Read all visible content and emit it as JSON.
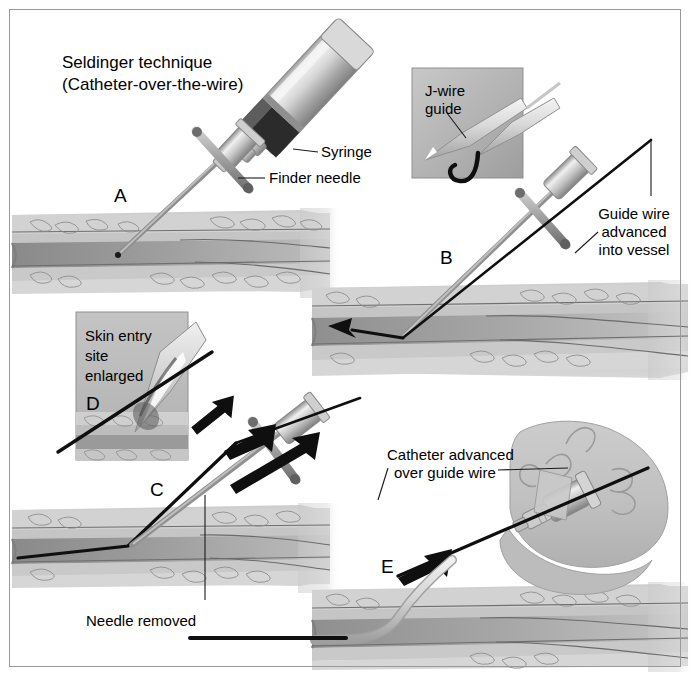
{
  "figure": {
    "title_line1": "Seldinger technique",
    "title_line2": "(Catheter-over-the-wire)",
    "background_color": "#ffffff",
    "border_color": "#9a9a9a",
    "ink_color": "#000000"
  },
  "panels": [
    {
      "letter": "A",
      "name": "needle-with-syringe-enters-vessel"
    },
    {
      "letter": "B",
      "name": "guide-wire-advanced-into-vessel"
    },
    {
      "letter": "C",
      "name": "needle-removed-over-wire"
    },
    {
      "letter": "D",
      "name": "skin-entry-site-enlarged-inset"
    },
    {
      "letter": "E",
      "name": "catheter-advanced-over-guide-wire"
    }
  ],
  "labels": {
    "syringe": "Syringe",
    "finder_needle": "Finder needle",
    "j_wire_guide_line1": "J-wire",
    "j_wire_guide_line2": "guide",
    "guide_wire_line1": "Guide wire",
    "guide_wire_line2": "advanced",
    "guide_wire_line3": "into vessel",
    "skin_entry_line1": "Skin entry",
    "skin_entry_line2": "site",
    "skin_entry_line3": "enlarged",
    "needle_removed": "Needle removed",
    "catheter_advanced_line1": "Catheter advanced",
    "catheter_advanced_line2": "over guide wire"
  },
  "colors": {
    "tissue_light": "#d7d7d7",
    "tissue_mid": "#b9b9b9",
    "vessel_lumen": "#949494",
    "vessel_wall": "#8d8d8d",
    "inset_bg": "#b4b4b4",
    "hand_fill": "#c3c3c3",
    "metal_light": "#e6e6e6",
    "metal_mid": "#b0b0b0",
    "metal_dark": "#707070",
    "wire_black": "#111111"
  }
}
